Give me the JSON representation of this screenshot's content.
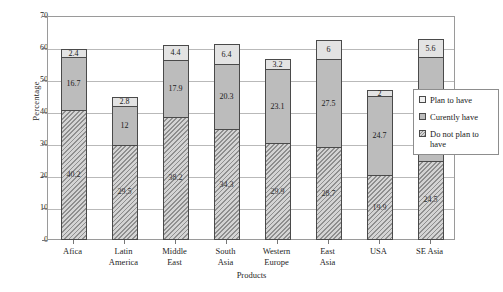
{
  "chart_data": {
    "type": "bar",
    "stacked": true,
    "title": "",
    "xlabel": "Products",
    "ylabel": "Percentage",
    "ylim": [
      0,
      70
    ],
    "ytick_step": 10,
    "yticks": [
      0,
      10,
      20,
      30,
      40,
      50,
      60,
      70
    ],
    "grid": true,
    "legend_position": "right",
    "categories": [
      "Afica",
      "Latin America",
      "Middle East",
      "South Asia",
      "Western Europe",
      "East Asia",
      "USA",
      "SE Asia"
    ],
    "series": [
      {
        "name": "Do not plan to have",
        "values": [
          40.2,
          29.5,
          38.2,
          34.3,
          29.9,
          28.7,
          19.9,
          24.5
        ]
      },
      {
        "name": "Curently have",
        "values": [
          16.7,
          12,
          17.9,
          20.3,
          23.1,
          27.5,
          24.7,
          32.3
        ]
      },
      {
        "name": "Plan to have",
        "values": [
          2.4,
          2.8,
          4.4,
          6.4,
          3.2,
          6,
          2,
          5.6
        ]
      }
    ]
  },
  "axes": {
    "y_title": "Percentage",
    "x_title": "Products",
    "y_tick_labels": [
      "0",
      "10",
      "20",
      "30",
      "40",
      "50",
      "60",
      "70"
    ],
    "x_tick_labels": [
      "Afica",
      "Latin America",
      "Middle East",
      "South Asia",
      "Western Europe",
      "East Asia",
      "USA",
      "SE Asia"
    ]
  },
  "legend": {
    "items": [
      {
        "label": "Plan to have",
        "swatch": "light-gray-square"
      },
      {
        "label": "Curently have",
        "swatch": "mid-gray-square"
      },
      {
        "label": "Do not plan to have",
        "swatch": "hatched-square"
      }
    ]
  },
  "colors": {
    "plan_to_have": "#e3e3e3",
    "currently_have": "#bcbcbc",
    "do_not_plan": "#d4d4d4",
    "outline": "#4a4a4a",
    "gridline": "#b9b9b9",
    "text": "#1a1a1a"
  }
}
